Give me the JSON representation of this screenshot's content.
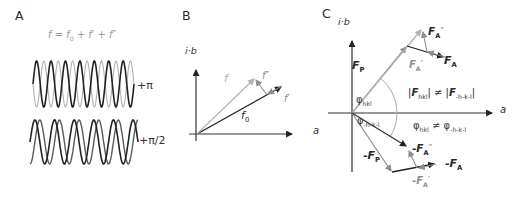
{
  "colors": {
    "dark": "#222222",
    "gray": "#8e8e8e",
    "light": "#b2b2b2",
    "mid": "#5a5a5a",
    "arc": "#aaaaaa",
    "text_dark": "#2a2a2a",
    "text_gray": "#9a9a9a"
  },
  "panels": {
    "a": {
      "label": "A",
      "equation": {
        "f1": "f",
        "eq": " = ",
        "f2": "f",
        "sub0": "0",
        "plus1": " + ",
        "f3": "f",
        "pr1": "′",
        "plus2": " + ",
        "f4": "f",
        "pr2": "″"
      },
      "waves": [
        {
          "label": "+π",
          "phase_shift": "π",
          "periods": 7,
          "x0": 33,
          "x1": 134,
          "cy": 84,
          "amp": 23,
          "series": [
            {
              "phase": 0,
              "color": "dark",
              "width": 1.6
            },
            {
              "phase": 3.14159,
              "color": "light",
              "width": 1.1
            }
          ]
        },
        {
          "label": "+π/2",
          "phase_shift": "π/2",
          "periods": 5.5,
          "x0": 30,
          "x1": 138,
          "cy": 142,
          "amp": 22,
          "series": [
            {
              "phase": 0,
              "color": "dark",
              "width": 1.6
            },
            {
              "phase": -1.5708,
              "color": "mid",
              "width": 1.4
            }
          ]
        }
      ]
    },
    "b": {
      "label": "B",
      "y_axis_label": "i·b",
      "x_axis_label": "a",
      "f0": {
        "base": "f",
        "sub": "0"
      },
      "f_prime": {
        "base": "f",
        "prime": "′"
      },
      "f_double_prime": {
        "base": "f",
        "prime": "″"
      },
      "f_resultant": {
        "base": "f"
      }
    },
    "c": {
      "label": "C",
      "y_axis_label": "i·b",
      "x_axis_label": "a",
      "FP": {
        "base": "F",
        "sub": "P"
      },
      "FA": {
        "base": "F",
        "sub": "A"
      },
      "FA_dp": {
        "base": "F",
        "sub": "A",
        "prime": "″"
      },
      "FA_p": {
        "base": "F",
        "sub": "A",
        "prime": "′"
      },
      "mFP": {
        "minus": "-",
        "base": "F",
        "sub": "P"
      },
      "mFA": {
        "minus": "-",
        "base": "F",
        "sub": "A"
      },
      "mFA_dp": {
        "minus": "-",
        "base": "F",
        "sub": "A",
        "prime": "″"
      },
      "mFA_p": {
        "minus": "-",
        "base": "F",
        "sub": "A",
        "prime": "′"
      },
      "phi_hkl": {
        "base": "φ",
        "sub": "hkl"
      },
      "phi_mhkl": {
        "base": "φ",
        "sub": "-h-k-l"
      },
      "amp_inequality": {
        "bar1": "|",
        "F1": "F",
        "sub1": "hkl",
        "bar2": "|",
        "neq": " ≠ ",
        "bar3": "|",
        "F2": "F",
        "sub2": "-h-k-l",
        "bar4": "|"
      },
      "phase_inequality": {
        "phi1": "φ",
        "sub1": "hkl",
        "neq": " ≠ ",
        "phi2": "φ",
        "sub2": "-h-k-l"
      }
    }
  }
}
